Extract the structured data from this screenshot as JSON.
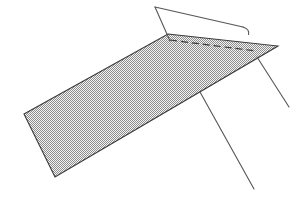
{
  "canvas": {
    "width": 303,
    "height": 198,
    "background_color": "#ffffff",
    "description": "Line drawing of a hatched parallelogram slab crossed by a bent linear element and two straight legs"
  },
  "style": {
    "stroke_color": "#3a3a3a",
    "stroke_color_light": "#55555a",
    "hatch_color": "#8a8a8a",
    "hatch_background": "#f2f2f2",
    "stroke_width": 1.1,
    "thin_stroke_width": 0.9,
    "dash_pattern": "7 4"
  },
  "shapes": {
    "slab": {
      "name": "hatched-parallelogram",
      "points": "168,34 278,46 55,177 24,114",
      "fill": "hatch",
      "stroke": "#3a3a3a",
      "vertices": [
        {
          "label": "top-left",
          "x": 168,
          "y": 34
        },
        {
          "label": "top-right",
          "x": 278,
          "y": 46
        },
        {
          "label": "bottom-right",
          "x": 55,
          "y": 177
        },
        {
          "label": "bottom-left",
          "x": 24,
          "y": 114
        }
      ]
    },
    "apex_line_left": {
      "name": "apex-to-slab-edge-line",
      "x1": 155,
      "y1": 7,
      "x2": 170,
      "y2": 41
    },
    "apex_line_right": {
      "name": "apex-upper-long-line",
      "x1": 155,
      "y1": 7,
      "x2": 243,
      "y2": 27
    },
    "apex_hook": {
      "name": "apex-line-hook-curve",
      "path": "M 243 27 Q 249 29 248 34"
    },
    "dashed_crease": {
      "name": "dashed-crease-line",
      "x1": 170,
      "y1": 40,
      "x2": 256,
      "y2": 51,
      "dash": "7 4"
    },
    "leg_right": {
      "name": "right-support-leg",
      "x1": 257,
      "y1": 57,
      "x2": 289,
      "y2": 107
    },
    "leg_left": {
      "name": "left-support-leg",
      "x1": 200,
      "y1": 92,
      "x2": 254,
      "y2": 189
    }
  },
  "chart_data": {
    "type": "diagram",
    "title": "",
    "elements": [
      {
        "id": "slab",
        "kind": "polygon",
        "label": "hatched parallelogram slab",
        "point_count": 4
      },
      {
        "id": "apex",
        "kind": "vertex",
        "label": "upper apex",
        "x": 155,
        "y": 7
      },
      {
        "id": "dashed_crease",
        "kind": "dashed-segment",
        "label": "hidden edge"
      },
      {
        "id": "leg_right",
        "kind": "segment",
        "label": "right leg"
      },
      {
        "id": "leg_left",
        "kind": "segment",
        "label": "left leg"
      }
    ]
  }
}
